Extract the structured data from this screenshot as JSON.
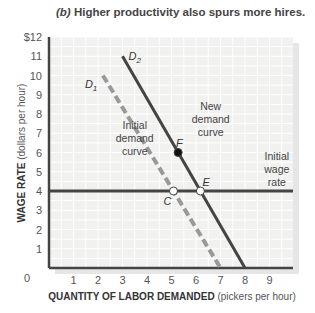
{
  "chart_data": {
    "type": "line",
    "title_prefix": "(b)",
    "title": "Higher productivity also spurs more hires.",
    "xlabel_bold": "QUANTITY OF LABOR DEMANDED",
    "xlabel_unit": "(pickers per hour)",
    "ylabel_bold": "WAGE RATE",
    "ylabel_unit": "(dollars per hour)",
    "xlim": [
      0,
      10
    ],
    "ylim": [
      0,
      12
    ],
    "x_ticks": [
      "0",
      "1",
      "2",
      "3",
      "4",
      "5",
      "6",
      "7",
      "8",
      "9"
    ],
    "y_ticks": [
      "0",
      "1",
      "2",
      "3",
      "4",
      "5",
      "6",
      "7",
      "8",
      "9",
      "10",
      "11",
      "$12"
    ],
    "grid": true,
    "series": [
      {
        "name": "D1",
        "label": "D",
        "sub": "1",
        "style": "dashed",
        "color": "#999999",
        "points": [
          [
            2.2,
            10
          ],
          [
            7,
            0
          ]
        ]
      },
      {
        "name": "D2",
        "label": "D",
        "sub": "2",
        "style": "solid",
        "color": "#444444",
        "points": [
          [
            3,
            11
          ],
          [
            8,
            0
          ]
        ]
      },
      {
        "name": "Initial wage rate",
        "style": "solid",
        "color": "#444444",
        "points": [
          [
            0,
            4
          ],
          [
            10,
            4
          ]
        ]
      }
    ],
    "points": [
      {
        "label": "C",
        "x": 5.08,
        "y": 4,
        "fill": "#ffffff"
      },
      {
        "label": "E",
        "x": 6.18,
        "y": 4,
        "fill": "#ffffff"
      },
      {
        "label": "F",
        "x": 5.27,
        "y": 6,
        "fill": "#111111"
      }
    ],
    "annotations": [
      {
        "text": [
          "Initial",
          "demand",
          "curve"
        ],
        "x": 3.5,
        "y": 7.2
      },
      {
        "text": [
          "New",
          "demand",
          "curve"
        ],
        "x": 6.6,
        "y": 8.2
      },
      {
        "text": [
          "Initial",
          "wage",
          "rate"
        ],
        "x": 9.3,
        "y": 5.6
      }
    ]
  }
}
